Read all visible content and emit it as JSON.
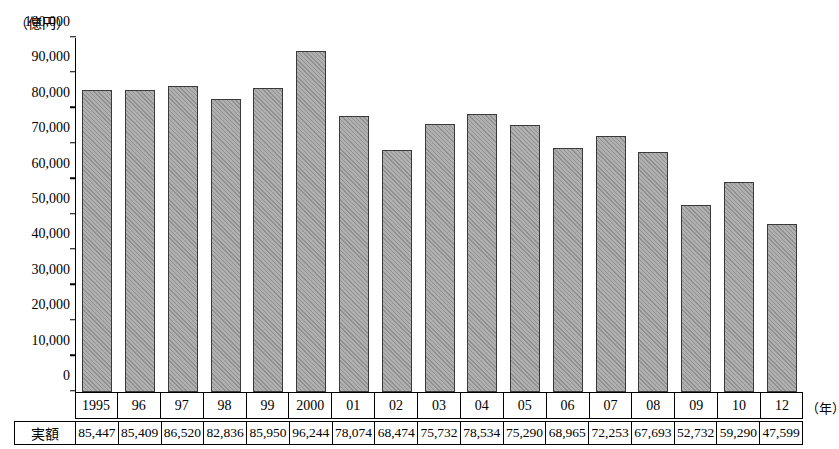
{
  "chart_data": {
    "type": "bar",
    "title": "",
    "unit_label": "（億円）",
    "xlabel": "（年）",
    "ylabel": "",
    "ylim": [
      0,
      100000
    ],
    "ytick_labels": [
      "0",
      "10,000",
      "20,000",
      "30,000",
      "40,000",
      "50,000",
      "60,000",
      "70,000",
      "80,000",
      "90,000",
      "100,000"
    ],
    "ytick_values": [
      0,
      10000,
      20000,
      30000,
      40000,
      50000,
      60000,
      70000,
      80000,
      90000,
      100000
    ],
    "grid": false,
    "legend": "none",
    "categories": [
      "1995",
      "96",
      "97",
      "98",
      "99",
      "2000",
      "01",
      "02",
      "03",
      "04",
      "05",
      "06",
      "07",
      "08",
      "09",
      "10",
      "12"
    ],
    "values": [
      85447,
      85409,
      86520,
      82836,
      85950,
      96244,
      78074,
      68474,
      75732,
      78534,
      75290,
      68965,
      72253,
      67693,
      52732,
      59290,
      47599
    ],
    "value_labels": [
      "85,447",
      "85,409",
      "86,520",
      "82,836",
      "85,950",
      "96,244",
      "78,074",
      "68,474",
      "75,732",
      "78,534",
      "75,290",
      "68,965",
      "72,253",
      "67,693",
      "52,732",
      "59,290",
      "47,599"
    ],
    "table_row_header": "実額",
    "bar_color": "#b0b0b0"
  }
}
